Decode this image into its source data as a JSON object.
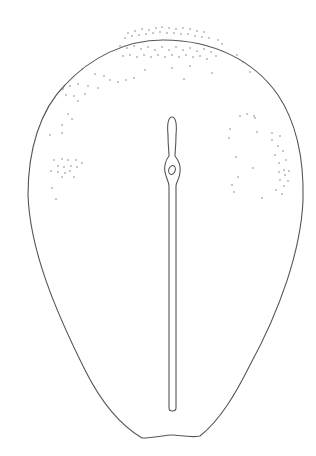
{
  "figure": {
    "stroke_color": "#555555",
    "dot_color": "#666666",
    "background": "#ffffff",
    "caption": ""
  }
}
